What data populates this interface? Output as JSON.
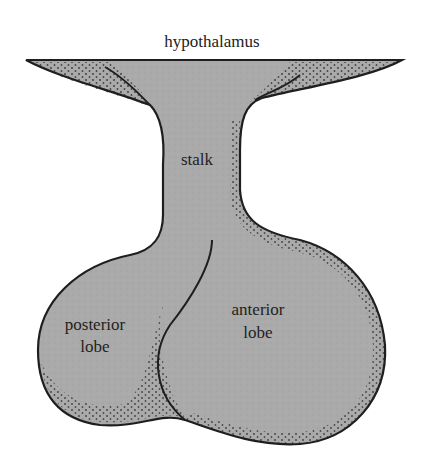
{
  "figure": {
    "type": "anatomical-diagram",
    "labels": {
      "hypothalamus": "hypothalamus",
      "stalk": "stalk",
      "posterior_line1": "posterior",
      "posterior_line2": "lobe",
      "anterior_line1": "anterior",
      "anterior_line2": "lobe"
    },
    "colors": {
      "fill": "#a9a9a9",
      "outline": "#1e1e1e",
      "dots": "#2a2a2a",
      "background": "#ffffff"
    }
  }
}
